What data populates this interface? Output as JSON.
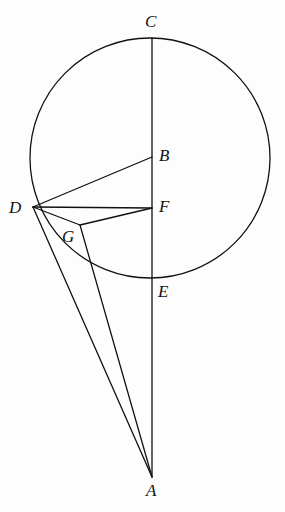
{
  "figure": {
    "background_color": "#fdfdfd",
    "stroke_color": "#111111",
    "width": 285,
    "height": 512
  },
  "labels": {
    "A": "A",
    "B": "B",
    "C": "C",
    "D": "D",
    "E": "E",
    "F": "F",
    "G": "G"
  },
  "chart_data": {
    "type": "diagram",
    "points": [
      {
        "name": "A",
        "x": 152,
        "y": 477,
        "label_x": 146,
        "label_y": 482,
        "on_circle": false,
        "note": "external apex below circle"
      },
      {
        "name": "B",
        "x": 152,
        "y": 157,
        "label_x": 159,
        "label_y": 147,
        "on_circle": false,
        "note": "center of circle"
      },
      {
        "name": "C",
        "x": 152,
        "y": 38,
        "label_x": 145,
        "label_y": 13,
        "on_circle": true,
        "note": "top of circle on line CA"
      },
      {
        "name": "D",
        "x": 33,
        "y": 207,
        "label_x": 9,
        "label_y": 199,
        "on_circle": true,
        "note": "left point on circle"
      },
      {
        "name": "E",
        "x": 152,
        "y": 278,
        "label_x": 158,
        "label_y": 283,
        "on_circle": true,
        "note": "bottom of circle on line CA"
      },
      {
        "name": "F",
        "x": 152,
        "y": 208,
        "label_x": 159,
        "label_y": 198,
        "on_circle": false,
        "note": "on chord CA, foot of DF"
      },
      {
        "name": "G",
        "x": 80,
        "y": 225,
        "label_x": 62,
        "label_y": 228,
        "on_circle": false,
        "note": "interior junction of DG, GF, GA"
      }
    ],
    "circle": {
      "cx": 150,
      "cy": 158,
      "r": 120,
      "stroke_width": 1.3
    },
    "segments": [
      {
        "from": "C",
        "to": "A",
        "stroke_width": 1.3
      },
      {
        "from": "D",
        "to": "B",
        "stroke_width": 1.3
      },
      {
        "from": "D",
        "to": "F",
        "stroke_width": 1.3
      },
      {
        "from": "D",
        "to": "G",
        "stroke_width": 1.3
      },
      {
        "from": "G",
        "to": "F",
        "stroke_width": 1.3
      },
      {
        "from": "D",
        "to": "A",
        "stroke_width": 1.3
      },
      {
        "from": "G",
        "to": "A",
        "stroke_width": 1.3
      }
    ]
  }
}
